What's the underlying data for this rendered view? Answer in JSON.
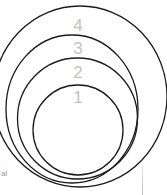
{
  "diagram": {
    "type": "nested-circles",
    "stroke_color": "#1a1a1a",
    "label_color": "#c2c2c2",
    "rings": [
      {
        "level": "1",
        "label": "1"
      },
      {
        "level": "2",
        "label": "2"
      },
      {
        "level": "3",
        "label": "3"
      },
      {
        "level": "4",
        "label": "4"
      }
    ],
    "cropped_text_fragment": "al"
  }
}
